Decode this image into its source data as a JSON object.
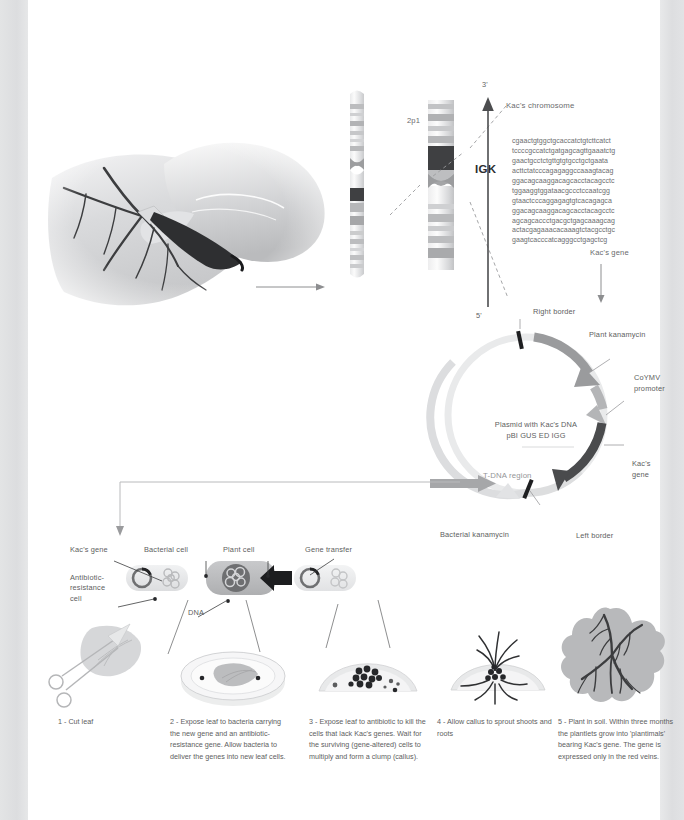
{
  "figure": {
    "type": "scientific-process-diagram"
  },
  "chromosome_panel": {
    "organism_label": "Kac's chromosome",
    "arm_label": "2p1",
    "band_labels": [
      "16",
      "15",
      "14",
      "13",
      "12",
      "11"
    ],
    "highlighted_band": "12",
    "gene_label": "IGK",
    "strand_start": "3'",
    "strand_end": "5'",
    "gene_caption": "Kac's gene",
    "sequence_lines": [
      "cgaactgtggctgcaccatctgtcttcatct",
      "tccccgccatctgatgagcagttgaaatctg",
      "gaactgcctctgttgtgtgcctgctgaata",
      "acttctatcccagagaggccaaagtacag",
      "ggacagcaaggacagcacctacagcctc",
      "tggaaggtggataacgccctccaatcgg",
      "gtaactcccaggagagtgtcacagagca",
      "ggacagcaaggacagcacctacagcctc",
      "agcagcaccctgacgctgagcaaagcag",
      "actacgagaaacacaaagtctacgcctgc",
      "gaagtcacccatcagggcctgagctcg"
    ]
  },
  "plasmid_panel": {
    "center_line1": "Plasmid with Kac's DNA",
    "center_line2": "pBI GUS ED IGG",
    "region_label": "T-DNA region",
    "labels": {
      "right_border": "Right border",
      "plant_kanamycin": "Plant kanamycin",
      "promoter_line1": "CoYMV",
      "promoter_line2": "promoter",
      "kacs_gene": "Kac's gene",
      "left_border": "Left border",
      "bacterial_kanamycin": "Bacterial kanamycin"
    },
    "colors": {
      "ring": "#e8e9ea",
      "plant_kanamycin": "#9a9b9d",
      "promoter": "#b4b5b7",
      "kacs_gene": "#4a4b4d",
      "tdna": "#dcdddf",
      "bacterial_kanamycin": "#a6a7a9",
      "border_mark": "#1e1f21"
    }
  },
  "transfer_panel": {
    "labels": {
      "kacs_gene": "Kac's gene",
      "bacterial_cell": "Bacterial cell",
      "plant_cell": "Plant cell",
      "gene_transfer": "Gene transfer",
      "antibiotic_resistance": "Antibiotic-\nresistance\ncell",
      "dna": "DNA"
    }
  },
  "steps": [
    {
      "number": "1",
      "text": "1 - Cut leaf"
    },
    {
      "number": "2",
      "text": "2 - Expose leaf to bacteria carrying the new gene and an antibiotic-resistance gene. Allow bacteria to deliver the genes into new leaf cells."
    },
    {
      "number": "3",
      "text": "3 - Expose leaf to antibiotic to kill the cells that lack Kac's genes. Wait for the surviving (gene-altered) cells to multiply and form a clump (callus)."
    },
    {
      "number": "4",
      "text": "4 - Allow callus to sprout shoots and roots"
    },
    {
      "number": "5",
      "text": "5 - Plant in soil. Within three months the plantlets grow into 'plantimals' bearing Kac's gene. The gene is expressed only in the red veins."
    }
  ],
  "palette": {
    "page_background": "#ffffff",
    "gutter": "#dcdddf",
    "text": "#5d5e60",
    "line": "#8d8e90",
    "dark_band": "#3f4042",
    "mid_gray": "#a9aaac",
    "light_gray": "#d8d9db",
    "vein_dark": "#3c3d3f"
  }
}
